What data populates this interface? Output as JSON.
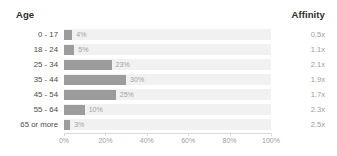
{
  "header": {
    "left_label": "Age",
    "right_label": "Affinity"
  },
  "colors": {
    "bar_fill": "#9c9c9c",
    "row_band": "#f1f1f1",
    "header_text": "#2d2d2d",
    "row_label_text": "#4a4a4a",
    "value_text": "#a3a3a3",
    "affinity_text": "#9e9e9e",
    "axis_line": "#dcdcdc",
    "background": "#ffffff"
  },
  "rows": [
    {
      "label": "0 - 17",
      "percent_label": "4%",
      "percent": 4,
      "affinity": "0.5x"
    },
    {
      "label": "18 - 24",
      "percent_label": "5%",
      "percent": 5,
      "affinity": "1.1x"
    },
    {
      "label": "25 - 34",
      "percent_label": "23%",
      "percent": 23,
      "affinity": "2.1x"
    },
    {
      "label": "35 - 44",
      "percent_label": "30%",
      "percent": 30,
      "affinity": "1.9x"
    },
    {
      "label": "45 - 54",
      "percent_label": "25%",
      "percent": 25,
      "affinity": "1.7x"
    },
    {
      "label": "55 - 64",
      "percent_label": "10%",
      "percent": 10,
      "affinity": "2.3x"
    },
    {
      "label": "65 or more",
      "percent_label": "3%",
      "percent": 3,
      "affinity": "2.5x"
    }
  ],
  "axis": {
    "ticks": [
      "0%",
      "20%",
      "40%",
      "60%",
      "80%",
      "100%"
    ],
    "tick_values": [
      0,
      20,
      40,
      60,
      80,
      100
    ]
  },
  "chart_data": {
    "type": "bar",
    "orientation": "horizontal",
    "title": "",
    "xlabel": "",
    "ylabel": "Age",
    "categories": [
      "0 - 17",
      "18 - 24",
      "25 - 34",
      "35 - 44",
      "45 - 54",
      "55 - 64",
      "65 or more"
    ],
    "series": [
      {
        "name": "Age",
        "values": [
          4,
          5,
          23,
          30,
          25,
          10,
          3
        ],
        "unit": "%"
      },
      {
        "name": "Affinity",
        "values": [
          0.5,
          1.1,
          2.1,
          1.9,
          1.7,
          2.3,
          2.5
        ],
        "unit": "x"
      }
    ],
    "values": [
      4,
      5,
      23,
      30,
      25,
      10,
      3
    ],
    "data_labels": [
      "4%",
      "5%",
      "23%",
      "30%",
      "25%",
      "10%",
      "3%"
    ],
    "xlim": [
      0,
      100
    ],
    "xticks": [
      0,
      20,
      40,
      60,
      80,
      100
    ],
    "xtick_labels": [
      "0%",
      "20%",
      "40%",
      "60%",
      "80%",
      "100%"
    ],
    "grid": false,
    "legend": "none"
  }
}
